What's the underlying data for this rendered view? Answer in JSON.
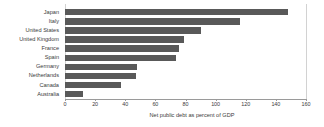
{
  "chart_data": {
    "type": "bar",
    "orientation": "horizontal",
    "title": "",
    "subtitle": "",
    "xlabel": "Net public debt as percent of GDP",
    "ylabel": "",
    "xlim": [
      0,
      160
    ],
    "xticks": [
      0,
      20,
      40,
      60,
      80,
      100,
      120,
      140,
      160
    ],
    "xtick_labels": [
      "0",
      "20",
      "40",
      "60",
      "80",
      "100",
      "120",
      "140",
      "160"
    ],
    "grid": false,
    "legend": false,
    "legend_position": "none",
    "bar_color": "#595959",
    "categories": [
      "Japan",
      "Italy",
      "United States",
      "United Kingdom",
      "France",
      "Spain",
      "Germany",
      "Netherlands",
      "Canada",
      "Australia"
    ],
    "values": [
      148,
      116,
      90,
      79,
      76,
      74,
      48,
      47,
      37,
      12
    ],
    "series": [
      {
        "name": "Net public debt as percent of GDP",
        "values": [
          148,
          116,
          90,
          79,
          76,
          74,
          48,
          47,
          37,
          12
        ]
      }
    ]
  }
}
